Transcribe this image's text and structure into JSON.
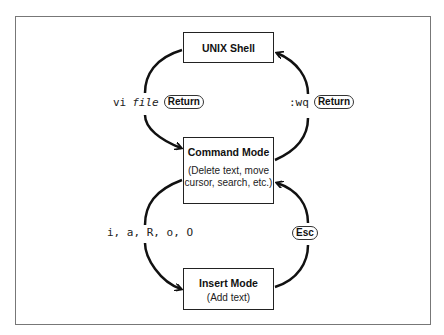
{
  "diagram": {
    "nodes": {
      "shell": {
        "title": "UNIX Shell"
      },
      "command": {
        "title": "Command Mode",
        "subtitle": "(Delete text, move cursor, search, etc.)"
      },
      "insert": {
        "title": "Insert Mode",
        "subtitle": "(Add text)"
      }
    },
    "edges": {
      "shell_to_command": {
        "cmd": "vi",
        "arg": "file",
        "key": "Return"
      },
      "command_to_shell": {
        "cmd": ":wq",
        "key": "Return"
      },
      "command_to_insert": {
        "cmd": "i, a, R, o, O"
      },
      "insert_to_command": {
        "key": "Esc"
      }
    }
  }
}
